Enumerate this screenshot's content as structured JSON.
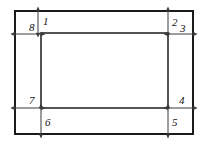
{
  "diagram": {
    "background_color": "#ffffff",
    "outer_rect": {
      "name": "outer-rectangle",
      "x": 15,
      "y": 11,
      "width": 178,
      "height": 123,
      "stroke_color": "#1a1a1a",
      "stroke_width": 2
    },
    "inner_rect": {
      "name": "inner-rectangle",
      "x": 41,
      "y": 33,
      "width": 127,
      "height": 75,
      "stroke_color": "#2b2b2b",
      "stroke_width": 1.6
    },
    "arrow_color": "#3a3a3a",
    "label_color": "#111111",
    "dimensions": [
      {
        "id": "1",
        "label": "1",
        "orientation": "vertical",
        "axis_pos": 38,
        "from": 11,
        "to": 33,
        "label_x": 43,
        "label_y": 25
      },
      {
        "id": "2",
        "label": "2",
        "orientation": "vertical",
        "axis_pos": 168,
        "from": 11,
        "to": 33,
        "label_x": 172,
        "label_y": 26
      },
      {
        "id": "3",
        "label": "3",
        "orientation": "horizontal",
        "axis_pos": 34,
        "from": 168,
        "to": 193,
        "label_x": 180,
        "label_y": 32
      },
      {
        "id": "4",
        "label": "4",
        "orientation": "horizontal",
        "axis_pos": 108,
        "from": 168,
        "to": 193,
        "label_x": 179,
        "label_y": 104
      },
      {
        "id": "5",
        "label": "5",
        "orientation": "vertical",
        "axis_pos": 168,
        "from": 108,
        "to": 134,
        "label_x": 172,
        "label_y": 126
      },
      {
        "id": "6",
        "label": "6",
        "orientation": "vertical",
        "axis_pos": 41,
        "from": 108,
        "to": 134,
        "label_x": 45,
        "label_y": 126
      },
      {
        "id": "7",
        "label": "7",
        "orientation": "horizontal",
        "axis_pos": 108,
        "from": 15,
        "to": 41,
        "label_x": 29,
        "label_y": 104
      },
      {
        "id": "8",
        "label": "8",
        "orientation": "horizontal",
        "axis_pos": 34,
        "from": 15,
        "to": 41,
        "label_x": 29,
        "label_y": 31
      }
    ]
  }
}
